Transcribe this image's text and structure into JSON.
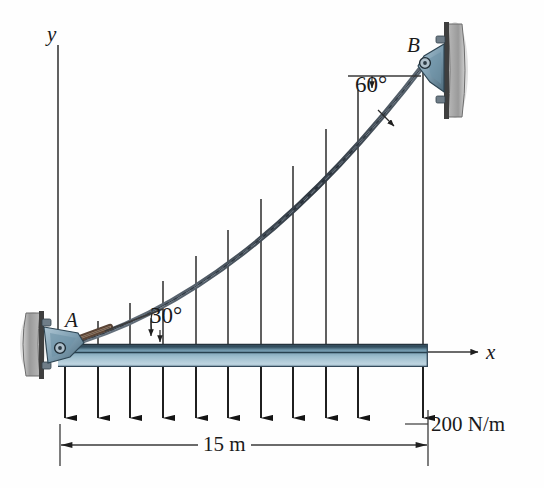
{
  "figure": {
    "background": "#fefefe"
  },
  "axes": {
    "y_label": "y",
    "x_label": "x",
    "y_axis": {
      "x": 58,
      "y_top": 45,
      "y_bottom": 352
    },
    "x_axis": {
      "y": 352,
      "x_left": 58,
      "x_right": 482
    }
  },
  "supports": [
    {
      "name": "A",
      "label": "A",
      "x": 58,
      "y": 348,
      "type": "pin-support",
      "wall_side": "left"
    },
    {
      "name": "B",
      "label": "B",
      "x": 425,
      "y": 63,
      "type": "pin-support",
      "wall_side": "right"
    }
  ],
  "angles": [
    {
      "name": "angle-at-B",
      "label": "60°",
      "value": 60,
      "unit": "deg",
      "at": "B",
      "reference": "horizontal"
    },
    {
      "name": "angle-at-A",
      "label": "30°",
      "value": 30,
      "unit": "deg",
      "at": "A",
      "reference": "horizontal"
    }
  ],
  "cable": {
    "shape": "parabola",
    "start": {
      "x": 58,
      "y": 348
    },
    "end": {
      "x": 425,
      "y": 63
    },
    "stroke": "#3b4450"
  },
  "beam": {
    "x_left": 58,
    "x_right": 428,
    "y_top": 344,
    "y_bottom": 367,
    "color_top": "#4c6d80",
    "color_mid": "#8fb2c4",
    "color_bottom": "#bdd4e0"
  },
  "hangers": {
    "count": 11,
    "x_positions": [
      65,
      98,
      130,
      163,
      196,
      228,
      261,
      293,
      326,
      358,
      423
    ]
  },
  "load": {
    "label": "200 N/m",
    "magnitude": 200,
    "unit": "N/m",
    "arrow_count": 11,
    "direction": "down",
    "arrow_top_y": 367,
    "arrow_tip_y": 420
  },
  "dimension": {
    "label": "15 m",
    "value": 15,
    "unit": "m",
    "x_start": 60,
    "x_end": 428,
    "y": 445
  },
  "colors": {
    "line": "#2a2a2a",
    "cable": "#3b4450",
    "bracket": "#8ba6b8",
    "bracket_dark": "#54707f",
    "wall_plate": "#a9a9a9",
    "text": "#1a1a1a"
  }
}
